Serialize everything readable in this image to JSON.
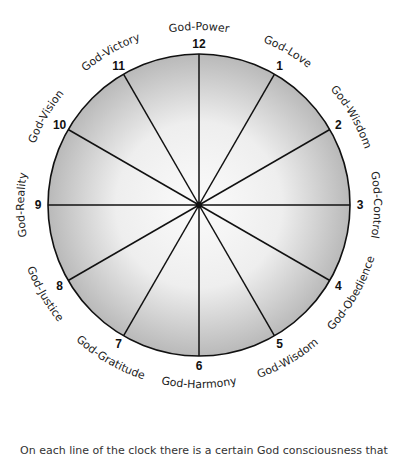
{
  "diagram": {
    "type": "clock-wheel",
    "center": [
      199,
      205
    ],
    "radius": 151,
    "colors": {
      "line": "#111111",
      "fill_center": "#fafafa",
      "fill_edge": "#b8b8b8",
      "text": "#222222"
    },
    "positions": [
      {
        "number": "12",
        "label": "God-Power"
      },
      {
        "number": "1",
        "label": "God-Love"
      },
      {
        "number": "2",
        "label": "God-Wisdom"
      },
      {
        "number": "3",
        "label": "God-Control"
      },
      {
        "number": "4",
        "label": "God-Obedience"
      },
      {
        "number": "5",
        "label": "God-Wisdom"
      },
      {
        "number": "6",
        "label": "God-Harmony"
      },
      {
        "number": "7",
        "label": "God-Gratitude"
      },
      {
        "number": "8",
        "label": "God-Justice"
      },
      {
        "number": "9",
        "label": "God-Reality"
      },
      {
        "number": "10",
        "label": "God-Vision"
      },
      {
        "number": "11",
        "label": "God-Victory"
      }
    ]
  },
  "caption": "On each line of the clock there is a certain God consciousness that"
}
